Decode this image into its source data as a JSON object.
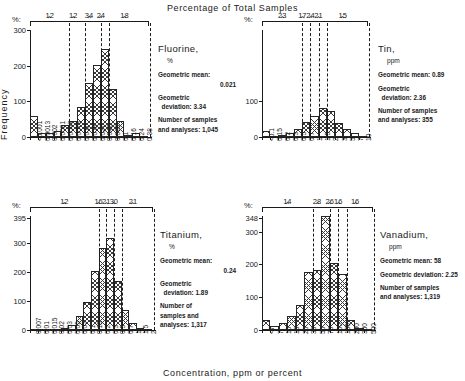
{
  "figure": {
    "top_title": "Percentage of Total Samples",
    "x_axis_title": "Concentration, ppm or percent",
    "y_axis_title": "Frequency",
    "pct_symbol": "%"
  },
  "chart_data": [
    {
      "type": "bar",
      "name": "Fluorine",
      "title": "Fluorine,",
      "unit": "%",
      "geometric_mean_label": "Geometric mean:",
      "geometric_mean": "0.021",
      "geometric_deviation_label": "Geometric",
      "geometric_deviation_label2": "deviation:",
      "geometric_deviation": "3.34",
      "samples_label": "Number of samples",
      "samples_label2": "and analyses:",
      "samples": "1,045",
      "categories": [
        "<0.001",
        "0.0013",
        "0.002",
        "0.0031",
        "0.0047",
        "0.0073",
        "0.011",
        "0.018",
        "0.027",
        "0.042",
        "0.065",
        "0.1",
        "0.16",
        "0.24",
        "0.38"
      ],
      "values": [
        60,
        12,
        10,
        18,
        35,
        44,
        85,
        152,
        203,
        248,
        135,
        45,
        5,
        12,
        2
      ],
      "ylim": [
        0,
        300
      ],
      "yticks": [
        0,
        100,
        200,
        300
      ],
      "ymax_label": "300",
      "pct_groups": [
        "12",
        "12",
        "34",
        "24",
        "18"
      ],
      "pct_group_spans": [
        [
          0,
          4
        ],
        [
          4,
          6
        ],
        [
          6,
          8
        ],
        [
          8,
          9
        ],
        [
          9,
          14
        ]
      ],
      "xlabel": "",
      "ylabel": "Frequency",
      "grid": false
    },
    {
      "type": "bar",
      "name": "Tin",
      "title": "Tin,",
      "unit": "ppm",
      "geometric_mean_label": "Geometric mean:",
      "geometric_mean": "0.89",
      "geometric_deviation_label": "Geometric",
      "geometric_deviation_label2": "deviation:",
      "geometric_deviation": "2.36",
      "samples_label": "Number of samples",
      "samples_label2": "and analyses:",
      "samples": "355",
      "categories": [
        "<0.1",
        "0.15",
        "0.2",
        "0.3",
        "0.5",
        "0.7",
        "1",
        "1.5",
        "2",
        "3",
        "5",
        "7",
        "10"
      ],
      "values": [
        18,
        3,
        5,
        12,
        22,
        42,
        60,
        82,
        72,
        40,
        22,
        12,
        3
      ],
      "ylim": [
        0,
        300
      ],
      "yticks": [
        0,
        100
      ],
      "ymax_label": "",
      "pct_groups": [
        "23",
        "17",
        "24",
        "21",
        "15"
      ],
      "pct_group_spans": [
        [
          0,
          4
        ],
        [
          4,
          5
        ],
        [
          5,
          6
        ],
        [
          6,
          7
        ],
        [
          7,
          12
        ]
      ],
      "xlabel": "",
      "ylabel": "Frequency",
      "grid": false
    },
    {
      "type": "bar",
      "name": "Titanium",
      "title": "Titanium,",
      "unit": "%",
      "geometric_mean_label": "Geometric mean:",
      "geometric_mean": "0.24",
      "geometric_deviation_label": "Geometric",
      "geometric_deviation_label2": "deviation:",
      "geometric_deviation": "1.89",
      "samples_label": "Number of",
      "samples_label2": "samples and",
      "samples_label3": "analyses:",
      "samples": "1,317",
      "categories": [
        "0.007",
        "0.01",
        "0.015",
        "0.02",
        "0.03",
        "0.05",
        "0.07",
        "0.1",
        "0.15",
        "0.2",
        "0.3",
        "0.5",
        "0.7",
        "1",
        "1.5",
        "2"
      ],
      "values": [
        2,
        3,
        4,
        5,
        6,
        16,
        50,
        96,
        203,
        285,
        320,
        170,
        70,
        25,
        6,
        2
      ],
      "ylim": [
        0,
        395
      ],
      "yticks": [
        0,
        100,
        200,
        300
      ],
      "ymax_label": "395",
      "pct_groups": [
        "12",
        "16",
        "21",
        "30",
        "21"
      ],
      "pct_group_spans": [
        [
          0,
          8
        ],
        [
          8,
          9
        ],
        [
          9,
          10
        ],
        [
          10,
          11
        ],
        [
          11,
          15
        ]
      ],
      "xlabel": "",
      "ylabel": "Frequency",
      "grid": false
    },
    {
      "type": "bar",
      "name": "Vanadium",
      "title": "Vanadium,",
      "unit": "ppm",
      "geometric_mean_label": "Geometric mean:",
      "geometric_mean": "58",
      "geometric_deviation_label": "Geometric deviation:",
      "geometric_deviation": "2.25",
      "samples_label": "Number of samples",
      "samples_label2": "and analyses:",
      "samples": "1,319",
      "categories": [
        "<7",
        "7",
        "10",
        "15",
        "20",
        "30",
        "50",
        "70",
        "100",
        "150",
        "200",
        "300",
        "500"
      ],
      "values": [
        30,
        12,
        22,
        42,
        75,
        176,
        184,
        348,
        205,
        170,
        32,
        5,
        3
      ],
      "ylim": [
        0,
        348
      ],
      "yticks": [
        0,
        100,
        200,
        300
      ],
      "ymax_label": "348",
      "pct_groups": [
        "14",
        "28",
        "26",
        "16",
        "16"
      ],
      "pct_group_spans": [
        [
          0,
          5
        ],
        [
          5,
          7
        ],
        [
          7,
          8
        ],
        [
          8,
          9
        ],
        [
          9,
          12
        ]
      ],
      "xlabel": "",
      "ylabel": "Frequency",
      "grid": false
    }
  ]
}
